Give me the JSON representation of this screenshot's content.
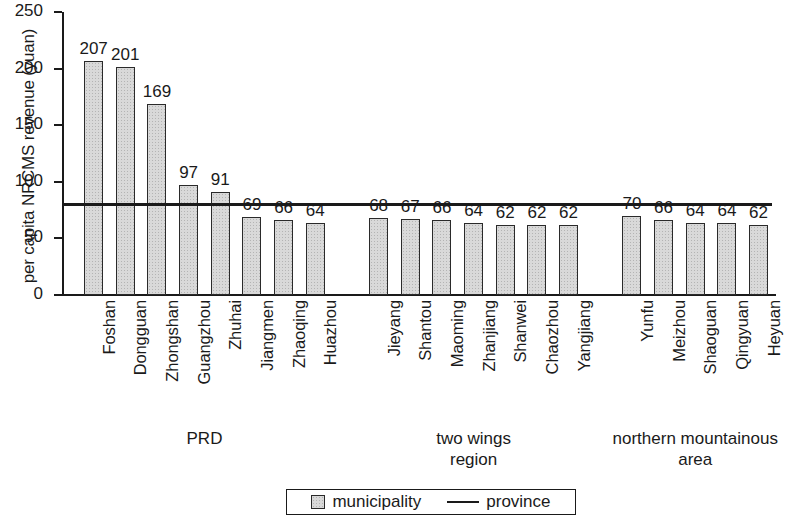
{
  "chart_data": {
    "type": "bar",
    "title": "",
    "xlabel": "",
    "ylabel": "per capita NRCMS revenue (yuan)",
    "ylim": [
      0,
      250
    ],
    "yticks": [
      0,
      50,
      100,
      150,
      200,
      250
    ],
    "grid": false,
    "legend_position": "bottom",
    "categories": [
      "Foshan",
      "Dongguan",
      "Zhongshan",
      "Guangzhou",
      "Zhuhai",
      "Jiangmen",
      "Zhaoqing",
      "Huazhou",
      "Jieyang",
      "Shantou",
      "Maoming",
      "Zhanjiang",
      "Shanwei",
      "Chaozhou",
      "Yangjiang",
      "Yunfu",
      "Meizhou",
      "Shaoguan",
      "Qingyuan",
      "Heyuan"
    ],
    "values": [
      207,
      201,
      169,
      97,
      91,
      69,
      66,
      64,
      68,
      67,
      66,
      64,
      62,
      62,
      62,
      70,
      66,
      64,
      64,
      62
    ],
    "series": [
      {
        "name": "municipality",
        "values": [
          207,
          201,
          169,
          97,
          91,
          69,
          66,
          64,
          68,
          67,
          66,
          64,
          62,
          62,
          62,
          70,
          66,
          64,
          64,
          62
        ]
      }
    ],
    "reference_line": {
      "name": "province",
      "value": 80
    },
    "groups": [
      {
        "label": "PRD",
        "start": 0,
        "end": 7
      },
      {
        "label": "two wings\nregion",
        "start": 8,
        "end": 14
      },
      {
        "label": "northern mountainous\narea",
        "start": 15,
        "end": 19
      }
    ]
  },
  "axis": {
    "y_title": "per capita NRCMS revenue (yuan)",
    "y_ticks": [
      "250",
      "200",
      "150",
      "100",
      "50",
      "0"
    ]
  },
  "legend": {
    "items": [
      {
        "label": "municipality",
        "marker": "square-swatch"
      },
      {
        "label": "province",
        "marker": "line-swatch"
      }
    ]
  },
  "groups": {
    "prd": "PRD",
    "two_wings": "two wings\nregion",
    "northern": "northern mountainous\narea"
  },
  "colors": {
    "bar_fill": "#d9d9d9",
    "bar_stroke": "#2a2a2a",
    "axis": "#1a1a1a",
    "reference_line": "#1a1a1a"
  }
}
